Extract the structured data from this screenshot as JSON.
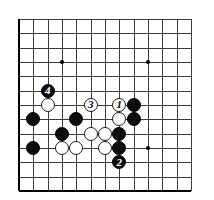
{
  "diagram": {
    "type": "go-board-diagram",
    "board": {
      "background_color": "#ffffff",
      "line_color": "#3a3a3a",
      "edge_color": "#000000",
      "cols": 13,
      "rows": 13,
      "cell_size": 14.33,
      "origin_x": 19,
      "origin_y": 19,
      "edges": {
        "left": true,
        "bottom": true,
        "top": false,
        "right": false
      }
    },
    "star_points": [
      {
        "col": 3,
        "row": 3
      },
      {
        "col": 9,
        "row": 3
      },
      {
        "col": 3,
        "row": 9
      },
      {
        "col": 9,
        "row": 9
      }
    ],
    "stones": [
      {
        "col": 2,
        "row": 5,
        "color": "black",
        "label": "4"
      },
      {
        "col": 2,
        "row": 6,
        "color": "white",
        "label": ""
      },
      {
        "col": 1,
        "row": 7,
        "color": "black",
        "label": ""
      },
      {
        "col": 4,
        "row": 7,
        "color": "black",
        "label": ""
      },
      {
        "col": 5,
        "row": 6,
        "color": "white",
        "label": "3"
      },
      {
        "col": 3,
        "row": 8,
        "color": "black",
        "label": ""
      },
      {
        "col": 5,
        "row": 8,
        "color": "white",
        "label": ""
      },
      {
        "col": 1,
        "row": 9,
        "color": "black",
        "label": ""
      },
      {
        "col": 3,
        "row": 9,
        "color": "white",
        "label": ""
      },
      {
        "col": 4,
        "row": 9,
        "color": "white",
        "label": ""
      },
      {
        "col": 7,
        "row": 6,
        "color": "white",
        "label": "1"
      },
      {
        "col": 8,
        "row": 6,
        "color": "black",
        "label": ""
      },
      {
        "col": 7,
        "row": 7,
        "color": "white",
        "label": ""
      },
      {
        "col": 8,
        "row": 7,
        "color": "black",
        "label": ""
      },
      {
        "col": 6,
        "row": 8,
        "color": "white",
        "label": ""
      },
      {
        "col": 7,
        "row": 8,
        "color": "black",
        "label": ""
      },
      {
        "col": 6,
        "row": 9,
        "color": "white",
        "label": ""
      },
      {
        "col": 7,
        "row": 9,
        "color": "black",
        "label": ""
      },
      {
        "col": 7,
        "row": 10,
        "color": "black",
        "label": "2"
      }
    ],
    "move_labels": [
      "1",
      "2",
      "3",
      "4"
    ],
    "colors": {
      "black_stone": "#0d0d0d",
      "white_stone": "#ffffff",
      "stone_outline": "#1a1a1a",
      "grid": "#3a3a3a",
      "border": "#000000"
    }
  }
}
